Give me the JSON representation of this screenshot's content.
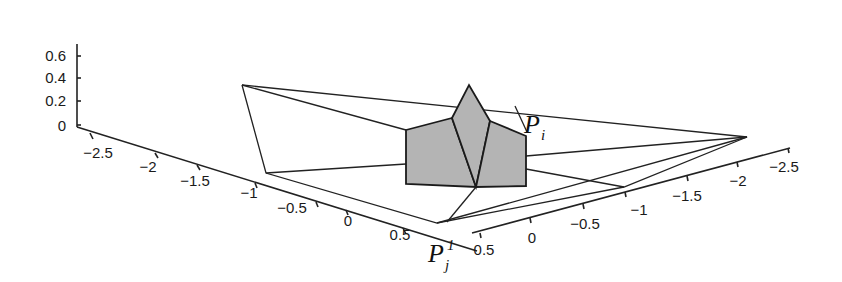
{
  "figure": {
    "type": "3d-wireframe-surface",
    "z_axis": {
      "ticks": [
        "0",
        "0.2",
        "0.4",
        "0.6"
      ]
    },
    "left_axis": {
      "ticks": [
        "-2.5",
        "-2",
        "-1.5",
        "-1",
        "-0.5",
        "0",
        "0.5"
      ]
    },
    "right_axis": {
      "ticks": [
        "0.5",
        "0",
        "-0.5",
        "-1",
        "-1.5",
        "-2",
        "-2.5"
      ]
    },
    "labels": {
      "p_i": {
        "main": "P",
        "sub": "i"
      },
      "p_j1": {
        "main": "P",
        "sub": "j",
        "sup": "1"
      }
    },
    "colors": {
      "face_fill": "#b4b4b4",
      "line": "#222222",
      "background": "#ffffff"
    }
  }
}
